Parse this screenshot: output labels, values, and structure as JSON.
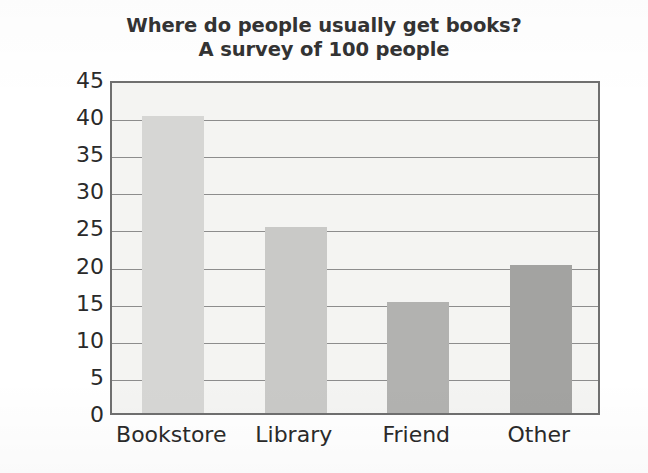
{
  "chart_data": {
    "type": "bar",
    "title": "Where do people usually get books? A survey of 100 people",
    "title_lines": [
      "Where do people usually get books?",
      "A survey of 100 people"
    ],
    "xlabel": "",
    "ylabel": "Number of People",
    "categories": [
      "Bookstore",
      "Library",
      "Friend",
      "Other"
    ],
    "values": [
      40,
      25,
      15,
      20
    ],
    "ylim": [
      0,
      45
    ],
    "ytick_step": 5,
    "yticks": [
      45,
      40,
      35,
      30,
      25,
      20,
      15,
      10,
      5,
      0
    ],
    "ytick_labels": [
      "45",
      "40",
      "35",
      "30",
      "25",
      "20",
      "15",
      "10",
      "5",
      "0"
    ],
    "grid": "horizontal",
    "legend": "none",
    "bar_colors": [
      "#d6d6d4",
      "#c9c9c7",
      "#b2b2b0",
      "#a3a3a1"
    ],
    "plot_background": "#f4f4f2",
    "axis_color": "#6f6f6f",
    "gridline_color": "#8d8d8d",
    "text_color": "#2a2a2a"
  }
}
